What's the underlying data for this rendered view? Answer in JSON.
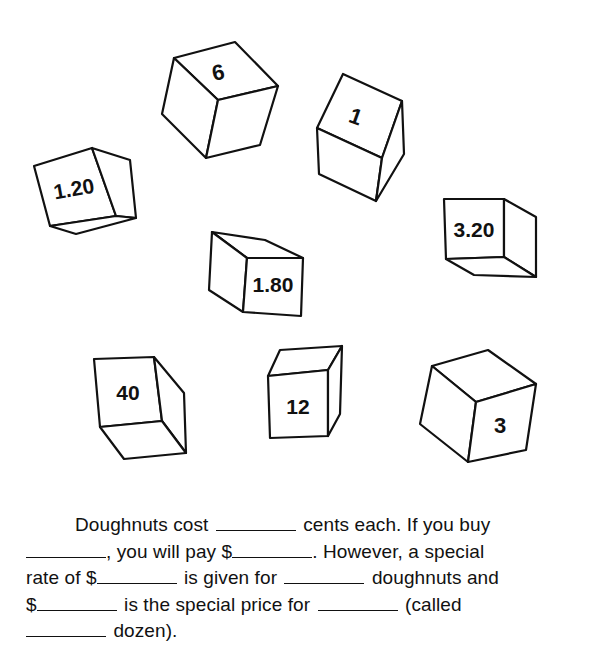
{
  "cubes": [
    {
      "id": "cube-6",
      "label": "6"
    },
    {
      "id": "cube-1",
      "label": "1"
    },
    {
      "id": "cube-1-20",
      "label": "1.20"
    },
    {
      "id": "cube-3-20",
      "label": "3.20"
    },
    {
      "id": "cube-1-80",
      "label": "1.80"
    },
    {
      "id": "cube-40",
      "label": "40"
    },
    {
      "id": "cube-12",
      "label": "12"
    },
    {
      "id": "cube-3",
      "label": "3"
    }
  ],
  "paragraph": {
    "line1": {
      "a": "Doughnuts cost",
      "b": "cents each. If you buy"
    },
    "line2": {
      "a": ", you will pay $",
      "b": ". However, a special"
    },
    "line3": {
      "a": "rate of $",
      "b": "is given for",
      "c": "doughnuts and"
    },
    "line4": {
      "a": "$",
      "b": "is the special price for",
      "c": "(called"
    },
    "line5": {
      "a": "dozen)."
    }
  }
}
